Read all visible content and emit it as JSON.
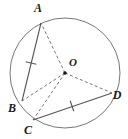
{
  "figure": {
    "type": "circle-geometry-diagram",
    "background_color": "#ffffff",
    "stroke_color": "#555555",
    "label_color": "#1a1a1a",
    "width": 128,
    "height": 139
  },
  "circle": {
    "name": "circumscribed-circle",
    "center_x": 65,
    "center_y": 73,
    "radius": 55,
    "stroke_color": "#777777",
    "stroke_width": 1,
    "fill": "none"
  },
  "center_point": {
    "label": "O",
    "x": 65,
    "y": 73,
    "label_x": 73,
    "label_y": 66,
    "dot_radius": 1.8
  },
  "points": [
    {
      "label": "A",
      "x": 41,
      "y": 23,
      "label_x": 38,
      "label_y": 12,
      "on_circle": true
    },
    {
      "label": "B",
      "x": 22,
      "y": 101,
      "label_x": 12,
      "label_y": 112,
      "on_circle": true
    },
    {
      "label": "C",
      "x": 33,
      "y": 120,
      "label_x": 28,
      "label_y": 134,
      "on_circle": true
    },
    {
      "label": "D",
      "x": 112,
      "y": 93,
      "label_x": 117,
      "label_y": 99,
      "on_circle": true
    }
  ],
  "chords": [
    {
      "name": "chord-AB",
      "from": "A",
      "to": "B",
      "style": "solid",
      "tick_marks": 1,
      "tick_x": 31,
      "tick_y": 63
    },
    {
      "name": "chord-CD",
      "from": "C",
      "to": "D",
      "style": "solid",
      "tick_marks": 1,
      "tick_x": 72,
      "tick_y": 106
    }
  ],
  "radii": [
    {
      "name": "radius-OA",
      "from": "O",
      "to": "A",
      "style": "dashed"
    },
    {
      "name": "radius-OB",
      "from": "O",
      "to": "B",
      "style": "dashed"
    },
    {
      "name": "radius-OC",
      "from": "O",
      "to": "C",
      "style": "dashed"
    },
    {
      "name": "radius-OD",
      "from": "O",
      "to": "D",
      "style": "dashed"
    }
  ],
  "labels": {
    "a": "A",
    "b": "B",
    "c": "C",
    "d": "D",
    "o": "O"
  },
  "label_font_size": 12
}
